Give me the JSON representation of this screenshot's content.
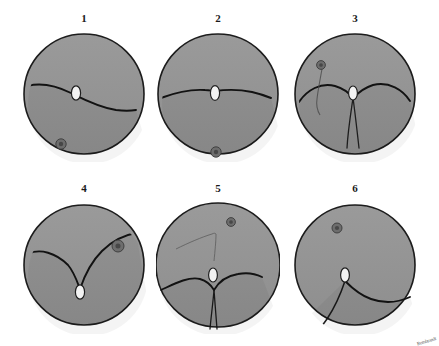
{
  "figure": {
    "kind": "fundus-diagram-series",
    "background_color": "#ffffff",
    "fundus_fill_color": "#9a9a9a",
    "fundus_fill_color_lower": "#8e8e8e",
    "outline_color": "#1c1c1c",
    "vessel_color": "#121212",
    "optic_disc_color": "#f2f2f2",
    "macula_color": "#6d6d6d",
    "signature": "Rembrandt",
    "panels": [
      {
        "label": "1",
        "description": "Horizontal retinal detachment border crossing below the optic disc, macula inferonasal",
        "optic_disc": {
          "cx": 50,
          "cy": 57,
          "rx": 4.6,
          "ry": 7.2
        },
        "macula": {
          "cx": 35,
          "cy": 108,
          "r": 5.2
        },
        "border_line": "M 1,50 C 16,46 33,51 45,57 C 57,63 72,71 90,74 C 98,75 104,75 110,74",
        "extra_line": ""
      },
      {
        "label": "2",
        "description": "Nearly horizontal detachment border through the optic disc level, macula inferior",
        "optic_disc": {
          "cx": 55,
          "cy": 57,
          "rx": 4.6,
          "ry": 7.4
        },
        "macula": {
          "cx": 56,
          "cy": 116,
          "r": 5.2
        },
        "border_line": "M 1,62 C 14,57 30,53 45,54 C 50,54 52,55 55,55 C 62,54 78,53 92,56 C 101,58 106,60 111,62",
        "extra_line": ""
      },
      {
        "label": "3",
        "description": "Bullous bilobed inferior detachment with a vertical fissure below the optic disc, macula superonasal with a feeder vessel",
        "optic_disc": {
          "cx": 56,
          "cy": 57,
          "rx": 4.4,
          "ry": 7.0
        },
        "macula": {
          "cx": 24,
          "cy": 29,
          "r": 4.4
        },
        "border_line": "M 2,66 C 10,54 24,46 38,50 C 48,53 53,58 56,62 C 60,58 66,52 76,49 C 92,45 106,54 113,65",
        "extra_line": "M 56,62 C 54,76 51,94 50,112 M 56,62 C 58,76 60,94 62,112"
      },
      {
        "label": "4",
        "description": "Superior bullous detachment descending in a V toward the optic disc, macula superotemporal",
        "optic_disc": {
          "cx": 54,
          "cy": 85,
          "rx": 4.6,
          "ry": 7.2
        },
        "macula": {
          "cx": 92,
          "cy": 39,
          "r": 6.0
        },
        "border_line": "M 2,47 C 14,41 30,46 42,58 C 48,65 51,74 54,82 C 58,70 64,56 76,44 C 86,34 98,28 110,26",
        "extra_line": ""
      },
      {
        "label": "5",
        "description": "Inferior bilobed detachment with deep vertical fissure plus faint superior demarcation line, macula superotemporal",
        "optic_disc": {
          "cx": 55,
          "cy": 70,
          "rx": 4.4,
          "ry": 7.0
        },
        "macula": {
          "cx": 73,
          "cy": 17,
          "r": 4.4
        },
        "border_line": "M 3,85 C 14,80 30,71 42,74 C 49,76 53,80 56,85 C 60,78 68,71 80,69 C 90,67 98,69 104,72",
        "extra_line": "M 56,85 C 55,98 53,112 52,124 M 56,85 C 57,98 58,112 59,124"
      },
      {
        "label": "6",
        "description": "Inferotemporal detachment border running from the optic disc down to the inferior periphery, macula superonasal",
        "optic_disc": {
          "cx": 48,
          "cy": 68,
          "rx": 4.4,
          "ry": 7.2
        },
        "macula": {
          "cx": 40,
          "cy": 21,
          "r": 5.0
        },
        "border_line": "M 48,74 C 54,80 62,88 74,92 C 88,97 102,95 113,90",
        "extra_line": "M 48,74 C 44,86 38,100 30,112 C 26,118 22,122 19,126"
      }
    ]
  }
}
